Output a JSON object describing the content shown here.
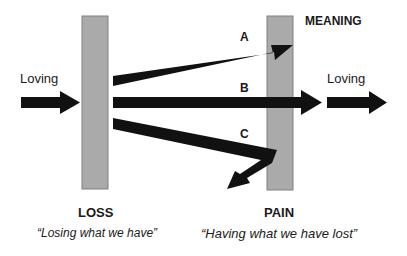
{
  "diagram": {
    "title_label": "MEANING",
    "left_input_label": "Loving",
    "right_output_label": "Loving",
    "paths": [
      {
        "id": "A",
        "label": "A"
      },
      {
        "id": "B",
        "label": "B"
      },
      {
        "id": "C",
        "label": "C"
      }
    ],
    "loss": {
      "title": "LOSS",
      "quote": "“Losing what we have”"
    },
    "pain": {
      "title": "PAIN",
      "quote": "“Having what we have lost”"
    },
    "colors": {
      "bar_fill": "#aaaaaa",
      "bar_stroke": "#808080",
      "arrow": "#111111",
      "text": "#1a1a1a"
    }
  }
}
